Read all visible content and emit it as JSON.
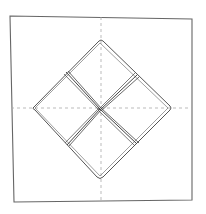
{
  "diagram": {
    "colors": {
      "background": "#ffffff",
      "stroke": "#555555",
      "dashed": "#aaaaaa"
    },
    "elements": [
      "outer-sheet",
      "vertical-crease",
      "horizontal-crease",
      "diamond-outline",
      "fold-lines"
    ]
  }
}
